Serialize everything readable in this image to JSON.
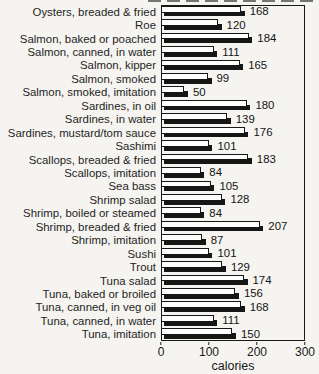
{
  "chart_data": {
    "type": "bar",
    "orientation": "horizontal",
    "title": "",
    "xlabel": "calories",
    "ylabel": "",
    "xlim": [
      0,
      300
    ],
    "x_ticks": [
      0,
      100,
      200,
      300
    ],
    "grid": false,
    "legend": "none",
    "bar_fill": "#fefefe",
    "bar_border": "#161616",
    "bar_shadow_color": "#161616",
    "categories": [
      "Oysters, breaded & fried",
      "Roe",
      "Salmon, baked or poached",
      "Salmon, canned, in water",
      "Salmon, kipper",
      "Salmon, smoked",
      "Salmon, smoked, imitation",
      "Sardines, in oil",
      "Sardines, in water",
      "Sardines, mustard/tom sauce",
      "Sashimi",
      "Scallops, breaded & fried",
      "Scallops, imitation",
      "Sea bass",
      "Shrimp salad",
      "Shrimp, boiled or steamed",
      "Shrimp, breaded & fried",
      "Shrimp, imitation",
      "Sushi",
      "Trout",
      "Tuna salad",
      "Tuna, baked or broiled",
      "Tuna, canned, in veg oil",
      "Tuna, canned, in water",
      "Tuna, imitation"
    ],
    "values": [
      168,
      120,
      184,
      111,
      165,
      99,
      50,
      180,
      139,
      176,
      101,
      183,
      84,
      105,
      128,
      84,
      207,
      87,
      101,
      129,
      174,
      156,
      168,
      111,
      150
    ]
  }
}
